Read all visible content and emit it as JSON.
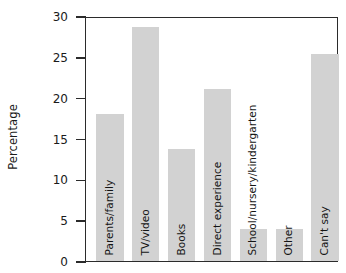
{
  "chart_data": {
    "type": "bar",
    "title": "",
    "subtitle": "",
    "xlabel": "",
    "ylabel": "Percentage",
    "ylim": [
      0,
      30
    ],
    "ytick_step": 5,
    "ytick_labels": [
      "30",
      "25",
      "20",
      "15",
      "10",
      "5",
      "0"
    ],
    "ytick_values": [
      30,
      25,
      20,
      15,
      10,
      5,
      0
    ],
    "grid": false,
    "legend": null,
    "legend_position": "none",
    "categories": [
      "Parents/family",
      "TV/video",
      "Books",
      "Direct experience",
      "School/nursery/kindergarten",
      "Other",
      "Can't say"
    ],
    "values": [
      18.2,
      28.9,
      13.8,
      21.2,
      4.0,
      4.0,
      25.6
    ],
    "bar_color": "#d2d2d2",
    "axis_color": "#2b2b2b",
    "text_color": "#1a1a1a",
    "label_placement": "inside-bar-rotated"
  }
}
